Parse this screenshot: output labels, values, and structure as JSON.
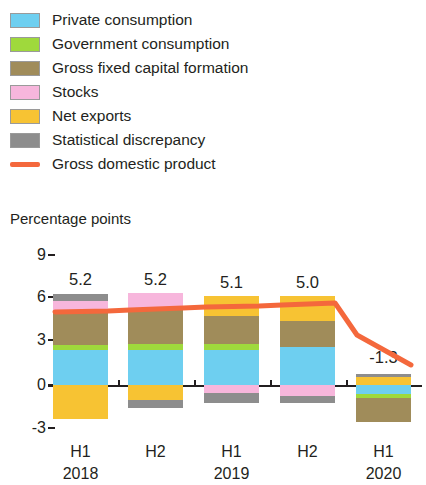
{
  "legend": {
    "items": [
      {
        "label": "Private consumption",
        "color": "#6ECFF0",
        "type": "swatch",
        "icon": "legend-swatch-icon"
      },
      {
        "label": "Government consumption",
        "color": "#9FD93C",
        "type": "swatch",
        "icon": "legend-swatch-icon"
      },
      {
        "label": "Gross fixed capital formation",
        "color": "#A08C5A",
        "type": "swatch",
        "icon": "legend-swatch-icon"
      },
      {
        "label": "Stocks",
        "color": "#F7B6DC",
        "type": "swatch",
        "icon": "legend-swatch-icon"
      },
      {
        "label": "Net exports",
        "color": "#F7C333",
        "type": "swatch",
        "icon": "legend-swatch-icon"
      },
      {
        "label": "Statistical discrepancy",
        "color": "#8D8D8D",
        "type": "swatch",
        "icon": "legend-swatch-icon"
      },
      {
        "label": "Gross domestic product",
        "color": "#F4683C",
        "type": "line",
        "icon": "legend-line-icon"
      }
    ]
  },
  "axis": {
    "title": "Percentage points",
    "yticks": [
      "9",
      "6",
      "3",
      "0",
      "-3"
    ],
    "xlabels": [
      {
        "period": "H1",
        "year": "2018"
      },
      {
        "period": "H2",
        "year": ""
      },
      {
        "period": "H1",
        "year": "2019"
      },
      {
        "period": "H2",
        "year": ""
      },
      {
        "period": "H1",
        "year": "2020"
      }
    ]
  },
  "chart_data": {
    "type": "bar",
    "title": "",
    "subtitle": "",
    "xlabel": "",
    "ylabel": "Percentage points",
    "ylim": [
      -3,
      9
    ],
    "yticks": [
      -3,
      0,
      3,
      6,
      9
    ],
    "grid": false,
    "legend_position": "top",
    "stacked": true,
    "categories": [
      "H1 2018",
      "H2 2018",
      "H1 2019",
      "H2 2019",
      "H1 2020"
    ],
    "series": [
      {
        "name": "Private consumption",
        "color": "#6ECFF0",
        "values": [
          2.5,
          2.6,
          2.7,
          2.3,
          0.7
        ]
      },
      {
        "name": "Government consumption",
        "color": "#9FD93C",
        "values": [
          0.3,
          0.3,
          0.3,
          0.0,
          0.2
        ]
      },
      {
        "name": "Gross fixed capital formation",
        "color": "#A08C5A",
        "values": [
          2.4,
          2.3,
          2.0,
          1.2,
          -1.7
        ]
      },
      {
        "name": "Stocks",
        "color": "#F7B6DC",
        "values": [
          0.7,
          0.9,
          -0.5,
          -0.8,
          0.0
        ]
      },
      {
        "name": "Net exports",
        "color": "#F7C333",
        "values": [
          -1.0,
          -1.0,
          1.4,
          1.8,
          0.6
        ]
      },
      {
        "name": "Statistical discrepancy",
        "color": "#8D8D8D",
        "values": [
          0.3,
          -0.6,
          -0.7,
          -0.5,
          0.1
        ]
      }
    ],
    "line_series": {
      "name": "Gross domestic product",
      "color": "#F4683C",
      "values": [
        5.2,
        5.2,
        5.1,
        5.0,
        -1.3
      ],
      "labels": [
        "5.2",
        "5.2",
        "5.1",
        "5.0",
        "-1.3"
      ]
    }
  },
  "bars": [
    {
      "name": "H1 2018",
      "value_label": "5.2",
      "value_label_y": 30,
      "center_x": 80.5,
      "segments": [
        {
          "name": "statistical-discrepancy",
          "color": "#8D8D8D",
          "top": 54,
          "height": 7
        },
        {
          "name": "stocks",
          "color": "#F7B6DC",
          "top": 61,
          "height": 11
        },
        {
          "name": "gross-fixed-capital-formation",
          "color": "#A08C5A",
          "top": 72,
          "height": 33
        },
        {
          "name": "government-consumption",
          "color": "#9FD93C",
          "top": 105,
          "height": 5
        },
        {
          "name": "private-consumption",
          "color": "#6ECFF0",
          "top": 110,
          "height": 35
        },
        {
          "name": "net-exports",
          "color": "#F7C333",
          "top": 145,
          "height": 34
        }
      ]
    },
    {
      "name": "H2 2018",
      "value_label": "5.2",
      "value_label_y": 30,
      "center_x": 155.5,
      "segments": [
        {
          "name": "stocks",
          "color": "#F7B6DC",
          "top": 53,
          "height": 17
        },
        {
          "name": "gross-fixed-capital-formation",
          "color": "#A08C5A",
          "top": 70,
          "height": 34
        },
        {
          "name": "government-consumption",
          "color": "#9FD93C",
          "top": 104,
          "height": 6
        },
        {
          "name": "private-consumption",
          "color": "#6ECFF0",
          "top": 110,
          "height": 35
        },
        {
          "name": "net-exports",
          "color": "#F7C333",
          "top": 145,
          "height": 15
        },
        {
          "name": "statistical-discrepancy",
          "color": "#8D8D8D",
          "top": 160,
          "height": 8
        }
      ]
    },
    {
      "name": "H1 2019",
      "value_label": "5.1",
      "value_label_y": 33,
      "center_x": 231.5,
      "segments": [
        {
          "name": "net-exports",
          "color": "#F7C333",
          "top": 56,
          "height": 20
        },
        {
          "name": "gross-fixed-capital-formation",
          "color": "#A08C5A",
          "top": 76,
          "height": 28
        },
        {
          "name": "government-consumption",
          "color": "#9FD93C",
          "top": 104,
          "height": 6
        },
        {
          "name": "private-consumption",
          "color": "#6ECFF0",
          "top": 110,
          "height": 35
        },
        {
          "name": "stocks",
          "color": "#F7B6DC",
          "top": 145,
          "height": 8
        },
        {
          "name": "statistical-discrepancy",
          "color": "#8D8D8D",
          "top": 153,
          "height": 10
        }
      ]
    },
    {
      "name": "H2 2019",
      "value_label": "5.0",
      "value_label_y": 33,
      "center_x": 307.5,
      "segments": [
        {
          "name": "net-exports",
          "color": "#F7C333",
          "top": 56,
          "height": 25
        },
        {
          "name": "gross-fixed-capital-formation",
          "color": "#A08C5A",
          "top": 81,
          "height": 26
        },
        {
          "name": "private-consumption",
          "color": "#6ECFF0",
          "top": 107,
          "height": 38
        },
        {
          "name": "stocks",
          "color": "#F7B6DC",
          "top": 145,
          "height": 11
        },
        {
          "name": "statistical-discrepancy",
          "color": "#8D8D8D",
          "top": 156,
          "height": 7
        }
      ]
    },
    {
      "name": "H1 2020",
      "value_label": "-1.3",
      "value_label_y": 108,
      "center_x": 383.5,
      "segments": [
        {
          "name": "statistical-discrepancy",
          "color": "#8D8D8D",
          "top": 134,
          "height": 3
        },
        {
          "name": "net-exports",
          "color": "#F7C333",
          "top": 137,
          "height": 8
        },
        {
          "name": "private-consumption",
          "color": "#6ECFF0",
          "top": 145,
          "height": 9
        },
        {
          "name": "government-consumption",
          "color": "#9FD93C",
          "top": 154,
          "height": 4
        },
        {
          "name": "gross-fixed-capital-formation",
          "color": "#A08C5A",
          "top": 158,
          "height": 24
        }
      ]
    }
  ],
  "geometry": {
    "ytick_positions": [
      15,
      57,
      100,
      145,
      188
    ],
    "zero_line_top": 145,
    "xtick_positions": [
      118,
      194,
      270,
      346
    ],
    "gdp_polyline": "55,72 108,71 130,70 183,68 206,67 259,66 282,65 335,63 357,95 411,125"
  }
}
